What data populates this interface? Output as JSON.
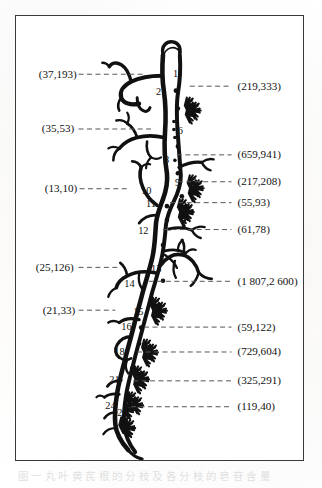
{
  "figure": {
    "border_color": "#3a3a3a",
    "ink_color": "#111111",
    "leader_line_color": "#555555",
    "caption": "图 一 丸 叶 黄 芪 根 的 分 枝 及 各 分 枝 的 皂 苷 含 量",
    "left_labels": [
      {
        "id": "left-1",
        "text": "(37,193)",
        "x": 38,
        "y": 77,
        "leader_from": 78,
        "leader_to": 143
      },
      {
        "id": "left-2",
        "text": "(35,53)",
        "x": 41,
        "y": 132,
        "leader_from": 78,
        "leader_to": 152
      },
      {
        "id": "left-3",
        "text": "(13,10)",
        "x": 44,
        "y": 192,
        "leader_from": 79,
        "leader_to": 128
      },
      {
        "id": "left-4",
        "text": "(25,126)",
        "x": 35,
        "y": 271,
        "leader_from": 78,
        "leader_to": 120
      },
      {
        "id": "left-5",
        "text": "(21,33)",
        "x": 42,
        "y": 314,
        "leader_from": 78,
        "leader_to": 115
      }
    ],
    "right_labels": [
      {
        "id": "right-1",
        "text": "(219,333)",
        "x": 238,
        "y": 89,
        "leader_from": 190,
        "leader_to": 232
      },
      {
        "id": "right-2",
        "text": "(659,941)",
        "x": 238,
        "y": 158,
        "leader_from": 177,
        "leader_to": 232
      },
      {
        "id": "right-3",
        "text": "(217,208)",
        "x": 238,
        "y": 185,
        "leader_from": 178,
        "leader_to": 232
      },
      {
        "id": "right-4",
        "text": "(55,93)",
        "x": 238,
        "y": 206,
        "leader_from": 170,
        "leader_to": 232
      },
      {
        "id": "right-5",
        "text": "(61,78)",
        "x": 238,
        "y": 233,
        "leader_from": 163,
        "leader_to": 232
      },
      {
        "id": "right-6",
        "text": "(1 807,2 600)",
        "x": 238,
        "y": 285,
        "leader_from": 149,
        "leader_to": 232
      },
      {
        "id": "right-7",
        "text": "(59,122)",
        "x": 238,
        "y": 331,
        "leader_from": 144,
        "leader_to": 232
      },
      {
        "id": "right-8",
        "text": "(729,604)",
        "x": 238,
        "y": 356,
        "leader_from": 137,
        "leader_to": 232
      },
      {
        "id": "right-9",
        "text": "(325,291)",
        "x": 238,
        "y": 385,
        "leader_from": 133,
        "leader_to": 232
      },
      {
        "id": "right-10",
        "text": "(119,40)",
        "x": 238,
        "y": 411,
        "leader_from": 131,
        "leader_to": 232
      }
    ],
    "node_labels": [
      {
        "id": "node-1",
        "text": "1",
        "x": 173,
        "y": 76
      },
      {
        "id": "node-2",
        "text": "2",
        "x": 156,
        "y": 94
      },
      {
        "id": "node-6",
        "text": "6",
        "x": 178,
        "y": 134
      },
      {
        "id": "node-8",
        "text": "8",
        "x": 164,
        "y": 163
      },
      {
        "id": "node-9",
        "text": "9",
        "x": 175,
        "y": 186
      },
      {
        "id": "node-10",
        "text": "10",
        "x": 141,
        "y": 194
      },
      {
        "id": "node-11",
        "text": "11",
        "x": 146,
        "y": 207
      },
      {
        "id": "node-12",
        "text": "12",
        "x": 138,
        "y": 234
      },
      {
        "id": "node-13",
        "text": "13",
        "x": 151,
        "y": 272
      },
      {
        "id": "node-14",
        "text": "14",
        "x": 124,
        "y": 287
      },
      {
        "id": "node-15",
        "text": "15",
        "x": 133,
        "y": 315
      },
      {
        "id": "node-16",
        "text": "16",
        "x": 121,
        "y": 330
      },
      {
        "id": "node-18",
        "text": "18",
        "x": 114,
        "y": 356
      },
      {
        "id": "node-21",
        "text": "21",
        "x": 109,
        "y": 384
      },
      {
        "id": "node-24",
        "text": "24",
        "x": 105,
        "y": 410
      },
      {
        "id": "node-25",
        "text": "25",
        "x": 117,
        "y": 417
      }
    ]
  },
  "chart_data": {
    "type": "diagram",
    "node_ids": [
      1,
      2,
      6,
      8,
      9,
      10,
      11,
      12,
      13,
      14,
      15,
      16,
      18,
      21,
      24,
      25
    ],
    "measurements": [
      {
        "node": 1,
        "side": "left",
        "value_pair": [
          37,
          193
        ],
        "label": "(37,193)"
      },
      {
        "node": 2,
        "side": "right",
        "value_pair": [
          219,
          333
        ],
        "label": "(219,333)"
      },
      {
        "node": 6,
        "side": "left",
        "value_pair": [
          35,
          53
        ],
        "label": "(35,53)"
      },
      {
        "node": 8,
        "side": "right",
        "value_pair": [
          659,
          941
        ],
        "label": "(659,941)"
      },
      {
        "node": 9,
        "side": "right",
        "value_pair": [
          217,
          208
        ],
        "label": "(217,208)"
      },
      {
        "node": 10,
        "side": "left",
        "value_pair": [
          13,
          10
        ],
        "label": "(13,10)"
      },
      {
        "node": 11,
        "side": "right",
        "value_pair": [
          55,
          93
        ],
        "label": "(55,93)"
      },
      {
        "node": 12,
        "side": "right",
        "value_pair": [
          61,
          78
        ],
        "label": "(61,78)"
      },
      {
        "node": 13,
        "side": "left",
        "value_pair": [
          25,
          126
        ],
        "label": "(25,126)"
      },
      {
        "node": 14,
        "side": "right",
        "value_pair": [
          1807,
          2600
        ],
        "label": "(1 807,2 600)"
      },
      {
        "node": 15,
        "side": "left",
        "value_pair": [
          21,
          33
        ],
        "label": "(21,33)"
      },
      {
        "node": 16,
        "side": "right",
        "value_pair": [
          59,
          122
        ],
        "label": "(59,122)"
      },
      {
        "node": 18,
        "side": "right",
        "value_pair": [
          729,
          604
        ],
        "label": "(729,604)"
      },
      {
        "node": 21,
        "side": "right",
        "value_pair": [
          325,
          291
        ],
        "label": "(325,291)"
      },
      {
        "node": 24,
        "side": "right",
        "value_pair": [
          119,
          40
        ],
        "label": "(119,40)"
      }
    ]
  }
}
